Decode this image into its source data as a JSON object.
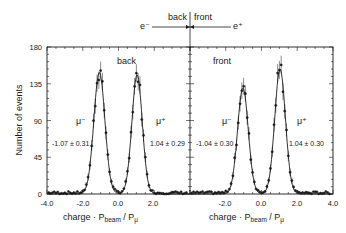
{
  "chart_data": {
    "type": "scatter",
    "title": "",
    "xlabel": "charge · P_beam / P_μ",
    "ylabel": "Number of events",
    "ylim": [
      0,
      180
    ],
    "yticks": [
      "0",
      "45",
      "90",
      "135",
      "180"
    ],
    "grid": false,
    "header_diagram": {
      "left_label": "back",
      "right_label": "front",
      "left_particle": "e⁻",
      "right_particle": "e⁺"
    },
    "panels": [
      {
        "name": "back",
        "xlim": [
          -4.0,
          4.0
        ],
        "xticks": [
          "-4.0",
          "-2.0",
          "0.0",
          "2.0"
        ],
        "peaks": [
          {
            "label": "μ⁻",
            "fit": "-1.07 ± 0.31",
            "center": -1.07,
            "sigma": 0.31,
            "height": 149
          },
          {
            "label": "μ⁺",
            "fit": "1.04 ± 0.29",
            "center": 1.04,
            "sigma": 0.29,
            "height": 146
          }
        ]
      },
      {
        "name": "front",
        "xlim": [
          -4.0,
          4.0
        ],
        "xticks": [
          "-2.0",
          "0.0",
          "2.0",
          "4.0"
        ],
        "peaks": [
          {
            "label": "μ⁻",
            "fit": "-1.04 ± 0.30",
            "center": -1.04,
            "sigma": 0.3,
            "height": 130
          },
          {
            "label": "μ⁺",
            "fit": "1.04 ± 0.30",
            "center": 1.04,
            "sigma": 0.3,
            "height": 153
          }
        ]
      }
    ]
  },
  "labels": {
    "ylabel": "Number of events",
    "xlabel_main": "charge · P",
    "xlabel_sub1": "beam",
    "xlabel_sep": " / P",
    "xlabel_sub2": "μ",
    "top_back": "back",
    "top_front": "front",
    "top_eminus": "e⁻",
    "top_eplus": "e⁺",
    "panel_back": "back",
    "panel_front": "front",
    "y0": "0",
    "y45": "45",
    "y90": "90",
    "y135": "135",
    "y180": "180",
    "lx0": "-4.0",
    "lx1": "-2.0",
    "lx2": "0.0",
    "lx3": "2.0",
    "rx1": "-2.0",
    "rx2": "0.0",
    "rx3": "2.0",
    "rx4": "4.0",
    "b_mum": "μ⁻",
    "b_mup": "μ⁺",
    "b_fit_m": "-1.07 ± 0.31",
    "b_fit_p": "1.04 ± 0.29",
    "f_mum": "μ⁻",
    "f_mup": "μ⁺",
    "f_fit_m": "-1.04 ± 0.30",
    "f_fit_p": "1.04 ± 0.30"
  }
}
